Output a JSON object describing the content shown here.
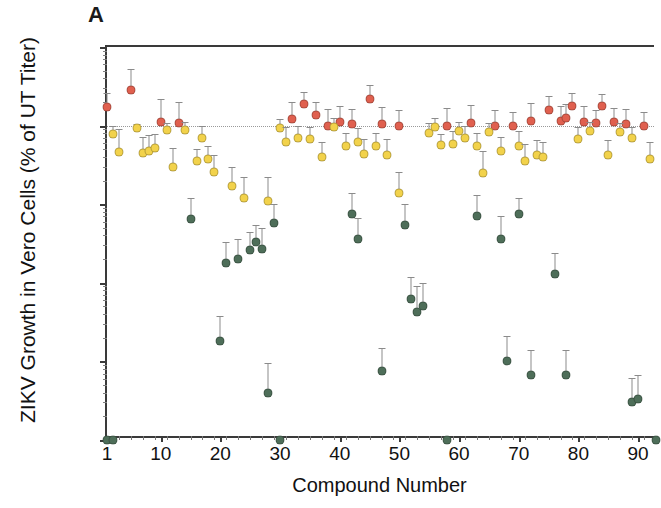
{
  "panel": {
    "label": "A"
  },
  "colors": {
    "red": "#e0604f",
    "yellow": "#f2d24b",
    "green": "#4e6e59",
    "axis": "#3a3a3a",
    "error_bar": "#8b8b8b",
    "reference_line": "#9a9a9a"
  },
  "chart_data": {
    "type": "scatter",
    "title": "A",
    "xlabel": "Compound Number",
    "ylabel": "ZIKV Growth in Vero Cells (% of UT Titer)",
    "yscale": "log",
    "ylim": [
      0.01,
      1000
    ],
    "ytick_labels": [
      "0.01",
      "0.1",
      "1",
      "10",
      "100",
      "1000"
    ],
    "ytick_values": [
      0.01,
      0.1,
      1,
      10,
      100,
      1000
    ],
    "xlim": [
      1,
      93
    ],
    "xtick_labels": [
      "1",
      "10",
      "20",
      "30",
      "40",
      "50",
      "60",
      "70",
      "80",
      "90"
    ],
    "xtick_values": [
      1,
      10,
      20,
      30,
      40,
      50,
      60,
      70,
      80,
      90
    ],
    "grid": false,
    "legend_position": "none",
    "annotations": [
      {
        "text": "dotted reference line at 100% of untreated titer",
        "y": 100
      }
    ],
    "series": [
      {
        "name": "No inhibition (>=100% UT titer)",
        "color": "#e0604f",
        "points": [
          {
            "x": 1,
            "y": 170,
            "yhigh": 260
          },
          {
            "x": 5,
            "y": 280,
            "yhigh": 520
          },
          {
            "x": 10,
            "y": 112,
            "yhigh": 220
          },
          {
            "x": 13,
            "y": 108,
            "yhigh": 200
          },
          {
            "x": 32,
            "y": 120,
            "yhigh": 200
          },
          {
            "x": 34,
            "y": 190,
            "yhigh": 270
          },
          {
            "x": 36,
            "y": 138,
            "yhigh": 200
          },
          {
            "x": 38,
            "y": 100,
            "yhigh": 165
          },
          {
            "x": 40,
            "y": 110,
            "yhigh": 180
          },
          {
            "x": 42,
            "y": 105,
            "yhigh": 165
          },
          {
            "x": 45,
            "y": 215,
            "yhigh": 330
          },
          {
            "x": 47,
            "y": 105,
            "yhigh": 170
          },
          {
            "x": 50,
            "y": 100,
            "yhigh": 158
          },
          {
            "x": 58,
            "y": 100,
            "yhigh": 168
          },
          {
            "x": 62,
            "y": 108,
            "yhigh": 185
          },
          {
            "x": 66,
            "y": 98,
            "yhigh": 160
          },
          {
            "x": 69,
            "y": 100,
            "yhigh": 150
          },
          {
            "x": 72,
            "y": 115,
            "yhigh": 195
          },
          {
            "x": 75,
            "y": 160,
            "yhigh": 240
          },
          {
            "x": 77,
            "y": 115,
            "yhigh": 180
          },
          {
            "x": 78,
            "y": 125,
            "yhigh": 190
          },
          {
            "x": 79,
            "y": 175,
            "yhigh": 260
          },
          {
            "x": 81,
            "y": 110,
            "yhigh": 175
          },
          {
            "x": 83,
            "y": 108,
            "yhigh": 160
          },
          {
            "x": 84,
            "y": 175,
            "yhigh": 250
          },
          {
            "x": 86,
            "y": 110,
            "yhigh": 168
          },
          {
            "x": 88,
            "y": 105,
            "yhigh": 165
          },
          {
            "x": 91,
            "y": 100,
            "yhigh": 150
          }
        ]
      },
      {
        "name": "Partial inhibition",
        "color": "#f2d24b",
        "points": [
          {
            "x": 2,
            "y": 78,
            "yhigh": 100
          },
          {
            "x": 3,
            "y": 46,
            "yhigh": 90
          },
          {
            "x": 6,
            "y": 92,
            "yhigh": 105
          },
          {
            "x": 7,
            "y": 45,
            "yhigh": 72
          },
          {
            "x": 8,
            "y": 48,
            "yhigh": 75
          },
          {
            "x": 9,
            "y": 52,
            "yhigh": 78
          },
          {
            "x": 11,
            "y": 88,
            "yhigh": 108
          },
          {
            "x": 12,
            "y": 30,
            "yhigh": 52
          },
          {
            "x": 14,
            "y": 88,
            "yhigh": 110
          },
          {
            "x": 16,
            "y": 35,
            "yhigh": 50
          },
          {
            "x": 17,
            "y": 70,
            "yhigh": 98
          },
          {
            "x": 18,
            "y": 38,
            "yhigh": 55
          },
          {
            "x": 19,
            "y": 26,
            "yhigh": 42
          },
          {
            "x": 22,
            "y": 17,
            "yhigh": 30
          },
          {
            "x": 24,
            "y": 12,
            "yhigh": 22
          },
          {
            "x": 28,
            "y": 11,
            "yhigh": 22
          },
          {
            "x": 30,
            "y": 92,
            "yhigh": 120
          },
          {
            "x": 31,
            "y": 62,
            "yhigh": 95
          },
          {
            "x": 33,
            "y": 70,
            "yhigh": 100
          },
          {
            "x": 35,
            "y": 68,
            "yhigh": 95
          },
          {
            "x": 37,
            "y": 40,
            "yhigh": 62
          },
          {
            "x": 39,
            "y": 96,
            "yhigh": 125
          },
          {
            "x": 41,
            "y": 55,
            "yhigh": 80
          },
          {
            "x": 43,
            "y": 62,
            "yhigh": 92
          },
          {
            "x": 44,
            "y": 44,
            "yhigh": 68
          },
          {
            "x": 46,
            "y": 55,
            "yhigh": 80
          },
          {
            "x": 48,
            "y": 42,
            "yhigh": 68
          },
          {
            "x": 50,
            "y": 14,
            "yhigh": 26
          },
          {
            "x": 55,
            "y": 80,
            "yhigh": 108
          },
          {
            "x": 56,
            "y": 95,
            "yhigh": 125
          },
          {
            "x": 57,
            "y": 56,
            "yhigh": 78
          },
          {
            "x": 59,
            "y": 58,
            "yhigh": 85
          },
          {
            "x": 60,
            "y": 85,
            "yhigh": 110
          },
          {
            "x": 61,
            "y": 70,
            "yhigh": 100
          },
          {
            "x": 63,
            "y": 55,
            "yhigh": 80
          },
          {
            "x": 64,
            "y": 25,
            "yhigh": 48
          },
          {
            "x": 65,
            "y": 82,
            "yhigh": 108
          },
          {
            "x": 67,
            "y": 48,
            "yhigh": 72
          },
          {
            "x": 70,
            "y": 55,
            "yhigh": 85
          },
          {
            "x": 71,
            "y": 35,
            "yhigh": 58
          },
          {
            "x": 73,
            "y": 42,
            "yhigh": 65
          },
          {
            "x": 74,
            "y": 40,
            "yhigh": 62
          },
          {
            "x": 80,
            "y": 68,
            "yhigh": 95
          },
          {
            "x": 82,
            "y": 85,
            "yhigh": 110
          },
          {
            "x": 85,
            "y": 42,
            "yhigh": 65
          },
          {
            "x": 87,
            "y": 82,
            "yhigh": 108
          },
          {
            "x": 89,
            "y": 70,
            "yhigh": 95
          },
          {
            "x": 92,
            "y": 38,
            "yhigh": 62
          }
        ]
      },
      {
        "name": "Strong inhibition",
        "color": "#4e6e59",
        "points": [
          {
            "x": 1,
            "y": 0.01,
            "yhigh": 0.01
          },
          {
            "x": 2,
            "y": 0.01,
            "yhigh": 0.01
          },
          {
            "x": 15,
            "y": 6.5,
            "yhigh": 12
          },
          {
            "x": 20,
            "y": 0.18,
            "yhigh": 0.38
          },
          {
            "x": 21,
            "y": 1.8,
            "yhigh": 3.3
          },
          {
            "x": 23,
            "y": 2.0,
            "yhigh": 3.6
          },
          {
            "x": 25,
            "y": 2.6,
            "yhigh": 4.4
          },
          {
            "x": 26,
            "y": 3.3,
            "yhigh": 5.5
          },
          {
            "x": 27,
            "y": 2.7,
            "yhigh": 5.0
          },
          {
            "x": 28,
            "y": 0.04,
            "yhigh": 0.095
          },
          {
            "x": 29,
            "y": 5.8,
            "yhigh": 10
          },
          {
            "x": 30,
            "y": 0.01,
            "yhigh": 0.01
          },
          {
            "x": 42,
            "y": 7.5,
            "yhigh": 14
          },
          {
            "x": 43,
            "y": 3.6,
            "yhigh": 6.6
          },
          {
            "x": 47,
            "y": 0.075,
            "yhigh": 0.15
          },
          {
            "x": 51,
            "y": 5.5,
            "yhigh": 10
          },
          {
            "x": 52,
            "y": 0.62,
            "yhigh": 1.2
          },
          {
            "x": 53,
            "y": 0.42,
            "yhigh": 0.9
          },
          {
            "x": 54,
            "y": 0.5,
            "yhigh": 1.0
          },
          {
            "x": 58,
            "y": 0.01,
            "yhigh": 0.01
          },
          {
            "x": 63,
            "y": 7.0,
            "yhigh": 13
          },
          {
            "x": 67,
            "y": 3.6,
            "yhigh": 7.0
          },
          {
            "x": 68,
            "y": 0.1,
            "yhigh": 0.21
          },
          {
            "x": 70,
            "y": 7.5,
            "yhigh": 12
          },
          {
            "x": 72,
            "y": 0.068,
            "yhigh": 0.14
          },
          {
            "x": 76,
            "y": 1.3,
            "yhigh": 2.4
          },
          {
            "x": 78,
            "y": 0.068,
            "yhigh": 0.14
          },
          {
            "x": 89,
            "y": 0.03,
            "yhigh": 0.062
          },
          {
            "x": 90,
            "y": 0.033,
            "yhigh": 0.068
          },
          {
            "x": 93,
            "y": 0.01,
            "yhigh": 0.01
          }
        ]
      }
    ]
  }
}
